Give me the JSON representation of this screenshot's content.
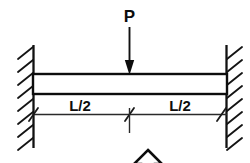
{
  "diagram": {
    "background_color": "#ffffff",
    "line_color": "#111111",
    "load": {
      "label": "P",
      "direction": "down",
      "position": "midspan",
      "arrow_icon": "down-arrow-icon"
    },
    "beam": {
      "name": "beam",
      "span_label": "L",
      "left_support_type": "fixed",
      "right_support_type": "fixed"
    },
    "dimensions": [
      {
        "label": "L/2",
        "segment": "left-half"
      },
      {
        "label": "L/2",
        "segment": "right-half"
      }
    ],
    "supports": [
      {
        "name": "left-fixed-support",
        "hatch_side": "left",
        "hatch_count": 8
      },
      {
        "name": "right-fixed-support",
        "hatch_side": "right",
        "hatch_count": 8
      }
    ],
    "annotation": {
      "name": "up-arrow-annotation",
      "icon": "up-arrow-icon",
      "description": "partial hollow upward arrow at bottom edge"
    }
  }
}
